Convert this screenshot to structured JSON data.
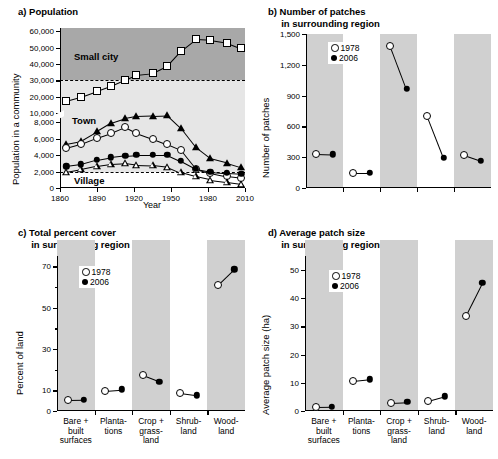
{
  "figure": {
    "panels": [
      "a",
      "b",
      "c",
      "d"
    ]
  },
  "chart_data": [
    {
      "id": "a",
      "type": "line",
      "title": "a) Population",
      "xlabel": "Year",
      "ylabel": "Population in a community",
      "xlim": [
        1860,
        2010
      ],
      "xticks": [
        1860,
        1890,
        1920,
        1950,
        1980,
        2010
      ],
      "xticklabels": [
        "1860",
        "1890",
        "1920",
        "1950",
        "1980",
        "2010"
      ],
      "yticks_lower": [
        0,
        2000,
        4000,
        6000,
        8000
      ],
      "yticks_upper": [
        10000,
        20000,
        30000,
        40000,
        50000,
        60000
      ],
      "yticklabels_lower": [
        "0",
        "2,000",
        "4,000",
        "6,000",
        "8,000"
      ],
      "yticklabels_upper": [
        "10,000",
        "20,000",
        "30,000",
        "40,000",
        "50,000",
        "60,000"
      ],
      "axis_break": true,
      "zones": [
        {
          "label": "Small city",
          "min": 30000,
          "max": 60000,
          "shade": "#a8a8a8"
        },
        {
          "label": "Town",
          "min": 2000,
          "max": 30000,
          "shade": "#e6e6e6"
        },
        {
          "label": "Village",
          "min": 0,
          "max": 2000,
          "shade": "#ffffff"
        }
      ],
      "threshold_lines": [
        30000,
        2000
      ],
      "x": [
        1865,
        1877,
        1890,
        1901,
        1913,
        1922,
        1935,
        1947,
        1958,
        1970,
        1982,
        1995,
        2007
      ],
      "series": [
        {
          "name": "small-city",
          "marker": "open-square",
          "values": [
            17500,
            20000,
            23500,
            26500,
            30500,
            33500,
            34500,
            39000,
            48000,
            55000,
            54500,
            53000,
            49500
          ]
        },
        {
          "name": "town-large",
          "marker": "filled-triangle",
          "values": [
            5400,
            5750,
            6900,
            7900,
            8500,
            8750,
            8800,
            8850,
            7300,
            5000,
            3600,
            3100,
            2550
          ]
        },
        {
          "name": "town-small",
          "marker": "open-circle",
          "values": [
            4850,
            5350,
            6100,
            6650,
            7400,
            6700,
            6000,
            5300,
            4600,
            2350,
            1800,
            1400,
            1200
          ]
        },
        {
          "name": "village-large",
          "marker": "filled-circle",
          "values": [
            2650,
            2900,
            3450,
            3750,
            3950,
            4050,
            4050,
            4050,
            3300,
            2350,
            2000,
            1850,
            1750
          ]
        },
        {
          "name": "village-small",
          "marker": "open-triangle",
          "values": [
            1950,
            2300,
            2700,
            2950,
            3050,
            2850,
            2800,
            2600,
            1900,
            1400,
            1000,
            750,
            500
          ]
        }
      ]
    },
    {
      "id": "b",
      "type": "scatter",
      "title": "b) Number of patches\n     in surrounding region",
      "ylabel": "Number of patches",
      "ylim": [
        0,
        1500
      ],
      "yticks": [
        0,
        300,
        600,
        900,
        1200,
        1500
      ],
      "yticklabels": [
        "0",
        "300",
        "600",
        "900",
        "1,200",
        "1,500"
      ],
      "categories": [
        "Bare + built surfaces",
        "Plantations",
        "Crop + grassland",
        "Shrubland",
        "Woodland"
      ],
      "legend": [
        {
          "label": "1978",
          "marker": "open-circle"
        },
        {
          "label": "2006",
          "marker": "filled-circle"
        }
      ],
      "series": [
        {
          "name": "1978",
          "values": [
            335,
            150,
            1385,
            700,
            320
          ]
        },
        {
          "name": "2006",
          "values": [
            330,
            150,
            965,
            295,
            265
          ]
        }
      ]
    },
    {
      "id": "c",
      "type": "scatter",
      "title": "c) Total percent cover\n     in surrounding region",
      "ylabel": "Percent of land",
      "ylim": [
        0,
        75
      ],
      "yticks": [
        0,
        10,
        30,
        50,
        70
      ],
      "yticklabels": [
        "0",
        "10",
        "30",
        "50",
        "70"
      ],
      "yminor": [
        20,
        40,
        60
      ],
      "categories": [
        "Bare +\nbuilt\nsurfaces",
        "Planta-\ntions",
        "Crop +\ngrass-\nland",
        "Shrub-\nland",
        "Wood-\nland"
      ],
      "legend": [
        {
          "label": "1978",
          "marker": "open-circle"
        },
        {
          "label": "2006",
          "marker": "filled-circle"
        }
      ],
      "series": [
        {
          "name": "1978",
          "values": [
            5.2,
            9.9,
            17.3,
            8.7,
            60.8
          ]
        },
        {
          "name": "2006",
          "values": [
            5.3,
            10.5,
            14.2,
            7.6,
            68.5
          ]
        }
      ]
    },
    {
      "id": "d",
      "type": "scatter",
      "title": "d) Average patch size\n     in surrounding region",
      "ylabel": "Average patch size (ha)",
      "ylim": [
        0,
        55
      ],
      "yticks": [
        0,
        10,
        20,
        30,
        40,
        50
      ],
      "yticklabels": [
        "0",
        "10",
        "20",
        "30",
        "40",
        "50"
      ],
      "categories": [
        "Bare +\nbuilt\nsurfaces",
        "Planta-\ntions",
        "Crop +\ngrass-\nland",
        "Shrub-\nland",
        "Wood-\nland"
      ],
      "legend": [
        {
          "label": "1978",
          "marker": "open-circle"
        },
        {
          "label": "2006",
          "marker": "filled-circle"
        }
      ],
      "series": [
        {
          "name": "1978",
          "values": [
            1.3,
            10.6,
            2.9,
            3.6,
            33.8
          ]
        },
        {
          "name": "2006",
          "values": [
            1.4,
            11.2,
            3.2,
            5.2,
            45.5
          ]
        }
      ]
    }
  ]
}
